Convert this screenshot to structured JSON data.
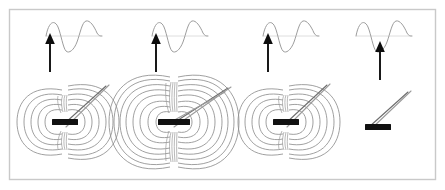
{
  "figure": {
    "title": "Magnetic dipole field strength comparison with alternating current signal",
    "background_color": "#ffffff",
    "border_color": "#c9c9c9",
    "field_line_color": "#8f8f8f",
    "magnet_color": "#111111",
    "arrow_color": "#0d0d0d",
    "wave_color": "#9d9d9d",
    "needle_color": "#9b9b9b",
    "panel_count": 4
  },
  "panels": [
    {
      "id": "panel-1",
      "label": "Panel 1",
      "field_strength": "medium",
      "field_rings": 7,
      "has_field": "yes",
      "magnet_width": 26,
      "magnet_height": 6,
      "needle_count": 2,
      "needle_angle_deg": 40,
      "arrow_label": "AC drive arrow",
      "wave_label": "Sine wave signal",
      "wave_cycles": 1.5
    },
    {
      "id": "panel-2",
      "label": "Panel 2",
      "field_strength": "strong",
      "field_rings": 9,
      "has_field": "yes",
      "magnet_width": 32,
      "magnet_height": 6,
      "needle_count": 3,
      "needle_angle_deg": 35,
      "arrow_label": "AC drive arrow",
      "wave_label": "Sine wave signal",
      "wave_cycles": 1.5
    },
    {
      "id": "panel-3",
      "label": "Panel 3",
      "field_strength": "medium",
      "field_rings": 7,
      "has_field": "yes",
      "magnet_width": 26,
      "magnet_height": 6,
      "needle_count": 2,
      "needle_angle_deg": 42,
      "arrow_label": "AC drive arrow",
      "wave_label": "Sine wave signal",
      "wave_cycles": 1.5
    },
    {
      "id": "panel-4",
      "label": "Panel 4",
      "field_strength": "none",
      "field_rings": 0,
      "has_field": "no",
      "magnet_width": 26,
      "magnet_height": 6,
      "needle_count": 2,
      "needle_angle_deg": 38,
      "arrow_label": "AC drive arrow",
      "wave_label": "Sine wave signal",
      "wave_cycles": 1.5
    }
  ],
  "icons": {
    "arrow_up": "arrow-up-icon",
    "sine_wave": "sine-wave-icon",
    "bar_magnet": "bar-magnet-icon",
    "field_lines": "magnetic-field-lines-icon",
    "needle": "compass-needle-icon"
  }
}
